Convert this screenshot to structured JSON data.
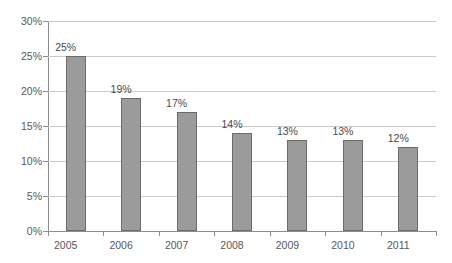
{
  "chart_data": {
    "type": "bar",
    "title": "",
    "subtitle": "",
    "xlabel": "",
    "ylabel": "",
    "categories": [
      "2005",
      "2006",
      "2007",
      "2008",
      "2009",
      "2010",
      "2011"
    ],
    "values": [
      25,
      19,
      17,
      14,
      13,
      13,
      12
    ],
    "data_labels": [
      "25%",
      "19%",
      "17%",
      "14%",
      "13%",
      "13%",
      "12%"
    ],
    "ylim": [
      0,
      30
    ],
    "ytick_values": [
      0,
      5,
      10,
      15,
      20,
      25,
      30
    ],
    "ytick_labels": [
      "0%",
      "5%",
      "10%",
      "15%",
      "20%",
      "25%",
      "30%"
    ],
    "grid": "horizontal",
    "legend": "none",
    "series": [
      {
        "name": "",
        "values": [
          25,
          19,
          17,
          14,
          13,
          13,
          12
        ]
      }
    ],
    "colors": {
      "bar_fill": "#9b9b9b",
      "bar_border": "#6b6b6b",
      "gridline": "#c9c9c9",
      "axis_line": "#8d8d8d",
      "tick_text": "#58585a",
      "label_text": "#4a4a4c",
      "background": "#ffffff"
    }
  }
}
